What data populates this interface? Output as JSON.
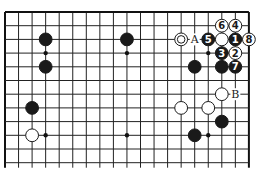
{
  "board": {
    "cols": 19,
    "rows": 12,
    "origin_x": 5,
    "origin_y": 12,
    "spacing_x": 13.55,
    "spacing_y": 13.7,
    "open_bottom": true,
    "line_color": "#222222",
    "edge_color": "#111111"
  },
  "hoshi": [
    [
      3,
      3
    ],
    [
      9,
      3
    ],
    [
      15,
      3
    ],
    [
      3,
      9
    ],
    [
      9,
      9
    ],
    [
      15,
      9
    ]
  ],
  "stones": [
    {
      "color": "black",
      "col": 3,
      "row": 2,
      "label": ""
    },
    {
      "color": "black",
      "col": 3,
      "row": 4,
      "label": ""
    },
    {
      "color": "black",
      "col": 9,
      "row": 2,
      "label": ""
    },
    {
      "color": "black",
      "col": 2,
      "row": 7,
      "label": ""
    },
    {
      "color": "white",
      "col": 2,
      "row": 9,
      "label": ""
    },
    {
      "color": "white",
      "col": 13,
      "row": 2,
      "label": "",
      "marked": true
    },
    {
      "color": "black",
      "col": 15,
      "row": 2,
      "label": "5"
    },
    {
      "color": "white",
      "col": 16,
      "row": 2,
      "label": ""
    },
    {
      "color": "black",
      "col": 17,
      "row": 2,
      "label": "1"
    },
    {
      "color": "white",
      "col": 18,
      "row": 2,
      "label": "8"
    },
    {
      "color": "white",
      "col": 16,
      "row": 1,
      "label": "6"
    },
    {
      "color": "white",
      "col": 17,
      "row": 1,
      "label": "4"
    },
    {
      "color": "black",
      "col": 16,
      "row": 3,
      "label": "3"
    },
    {
      "color": "white",
      "col": 17,
      "row": 3,
      "label": "2"
    },
    {
      "color": "black",
      "col": 14,
      "row": 4,
      "label": ""
    },
    {
      "color": "black",
      "col": 16,
      "row": 4,
      "label": ""
    },
    {
      "color": "black",
      "col": 17,
      "row": 4,
      "label": "7"
    },
    {
      "color": "white",
      "col": 16,
      "row": 6,
      "label": ""
    },
    {
      "color": "white",
      "col": 13,
      "row": 7,
      "label": ""
    },
    {
      "color": "white",
      "col": 15,
      "row": 7,
      "label": ""
    },
    {
      "color": "black",
      "col": 16,
      "row": 8,
      "label": ""
    },
    {
      "color": "black",
      "col": 14,
      "row": 9,
      "label": ""
    }
  ],
  "letters": [
    {
      "text": "A",
      "col": 14,
      "row": 2
    },
    {
      "text": "B",
      "col": 17,
      "row": 6
    }
  ]
}
